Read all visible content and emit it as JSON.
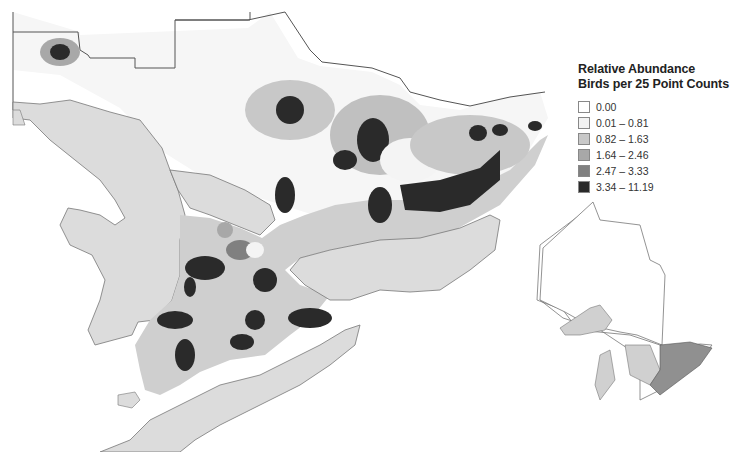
{
  "legend": {
    "title_line1": "Relative Abundance",
    "title_line2": "Birds per 25 Point Counts",
    "items": [
      {
        "label": "0.00",
        "color": "#ffffff"
      },
      {
        "label": "0.01 – 0.81",
        "color": "#f2f2f2"
      },
      {
        "label": "0.82 – 1.63",
        "color": "#c8c8c8"
      },
      {
        "label": "1.64 – 2.46",
        "color": "#a8a8a8"
      },
      {
        "label": "2.47 – 3.33",
        "color": "#808080"
      },
      {
        "label": "3.34 – 11.19",
        "color": "#2a2a2a"
      }
    ]
  },
  "colors": {
    "water": "#dcdcdc",
    "land_outside": "#ffffff",
    "border": "#555555",
    "lake_outline": "#777777"
  },
  "inset": {
    "description": "Ontario locator map with study area highlighted"
  }
}
